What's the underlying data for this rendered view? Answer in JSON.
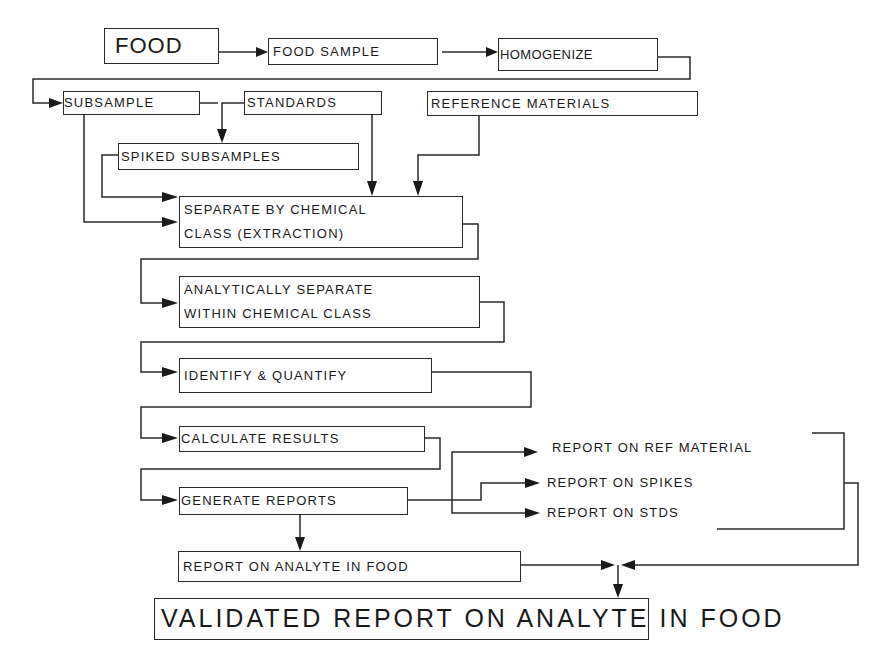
{
  "diagram": {
    "type": "flowchart",
    "nodes": {
      "food": "FOOD",
      "food_sample": "FOOD SAMPLE",
      "homogenize": "HOMOGENIZE",
      "subsample": "SUBSAMPLE",
      "standards": "STANDARDS",
      "reference_materials": "REFERENCE MATERIALS",
      "spiked_subsamples": "SPIKED SUBSAMPLES",
      "separate_line1": "SEPARATE BY CHEMICAL",
      "separate_line2": "CLASS (EXTRACTION)",
      "analytically_line1": "ANALYTICALLY SEPARATE",
      "analytically_line2": "WITHIN CHEMICAL CLASS",
      "identify": "IDENTIFY & QUANTIFY",
      "calculate": "CALCULATE RESULTS",
      "generate": "GENERATE REPORTS",
      "report_ref": "REPORT ON REF MATERIAL",
      "report_spikes": "REPORT ON SPIKES",
      "report_stds": "REPORT ON STDS",
      "report_analyte": "REPORT ON ANALYTE IN FOOD",
      "validated": "VALIDATED REPORT ON ANALYTE IN FOOD"
    },
    "edges": [
      [
        "FOOD",
        "FOOD SAMPLE"
      ],
      [
        "FOOD SAMPLE",
        "HOMOGENIZE"
      ],
      [
        "HOMOGENIZE",
        "SUBSAMPLE"
      ],
      [
        "SUBSAMPLE",
        "SPIKED SUBSAMPLES"
      ],
      [
        "STANDARDS",
        "SPIKED SUBSAMPLES"
      ],
      [
        "SUBSAMPLE",
        "SEPARATE BY CHEMICAL CLASS (EXTRACTION)"
      ],
      [
        "SPIKED SUBSAMPLES",
        "SEPARATE BY CHEMICAL CLASS (EXTRACTION)"
      ],
      [
        "STANDARDS",
        "SEPARATE BY CHEMICAL CLASS (EXTRACTION)"
      ],
      [
        "REFERENCE MATERIALS",
        "SEPARATE BY CHEMICAL CLASS (EXTRACTION)"
      ],
      [
        "SEPARATE BY CHEMICAL CLASS (EXTRACTION)",
        "ANALYTICALLY SEPARATE WITHIN CHEMICAL CLASS"
      ],
      [
        "ANALYTICALLY SEPARATE WITHIN CHEMICAL CLASS",
        "IDENTIFY & QUANTIFY"
      ],
      [
        "IDENTIFY & QUANTIFY",
        "CALCULATE RESULTS"
      ],
      [
        "CALCULATE RESULTS",
        "GENERATE REPORTS"
      ],
      [
        "GENERATE REPORTS",
        "REPORT ON REF MATERIAL"
      ],
      [
        "GENERATE REPORTS",
        "REPORT ON SPIKES"
      ],
      [
        "GENERATE REPORTS",
        "REPORT ON STDS"
      ],
      [
        "GENERATE REPORTS",
        "REPORT ON ANALYTE IN FOOD"
      ],
      [
        "REPORT ON ANALYTE IN FOOD",
        "VALIDATED REPORT ON ANALYTE IN FOOD"
      ],
      [
        "REPORT ON REF MATERIAL / SPIKES / STDS",
        "VALIDATED REPORT ON ANALYTE IN FOOD"
      ]
    ],
    "colors": {
      "stroke": "#2a2a2a",
      "background": "#ffffff",
      "text": "#1a1a1a"
    }
  }
}
